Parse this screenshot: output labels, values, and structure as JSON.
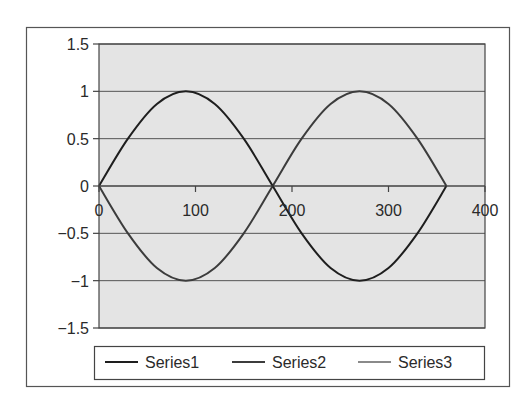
{
  "chart_data": {
    "type": "line",
    "title": "",
    "xlabel": "",
    "ylabel": "",
    "xlim": [
      0,
      400
    ],
    "ylim": [
      -1.5,
      1.5
    ],
    "x_ticks": [
      0,
      100,
      200,
      300,
      400
    ],
    "x_tick_labels": [
      "0",
      "100",
      "200",
      "300",
      "400"
    ],
    "y_ticks": [
      1.5,
      1,
      0.5,
      0,
      -0.5,
      -1,
      -1.5
    ],
    "y_tick_labels": [
      "1.5",
      "1",
      "0.5",
      "0",
      "−0.5",
      "−1",
      "−1.5"
    ],
    "grid": "horizontal major gridlines",
    "legend_position": "bottom",
    "x": [
      0,
      30,
      60,
      90,
      120,
      150,
      180,
      210,
      240,
      270,
      300,
      330,
      360
    ],
    "series": [
      {
        "name": "Series1",
        "color": "#1e1e1e",
        "values": [
          0,
          0.5,
          0.866,
          1,
          0.866,
          0.5,
          0,
          -0.5,
          -0.866,
          -1,
          -0.866,
          -0.5,
          0
        ]
      },
      {
        "name": "Series2",
        "color": "#3c3c3c",
        "values": [
          0,
          -0.5,
          -0.866,
          -1,
          -0.866,
          -0.5,
          0,
          0.5,
          0.866,
          1,
          0.866,
          0.5,
          0
        ]
      },
      {
        "name": "Series3",
        "color": "#8a8a8a",
        "values": [
          0,
          0,
          0,
          0,
          0,
          0,
          0,
          0,
          0,
          0,
          0,
          0,
          0
        ]
      }
    ]
  },
  "legend": {
    "items": [
      {
        "label": "Series1",
        "color": "#1e1e1e"
      },
      {
        "label": "Series2",
        "color": "#3c3c3c"
      },
      {
        "label": "Series3",
        "color": "#8a8a8a"
      }
    ]
  },
  "colors": {
    "plot_background": "#e4e4e4",
    "gridline": "#555555",
    "frame": "#444444"
  }
}
